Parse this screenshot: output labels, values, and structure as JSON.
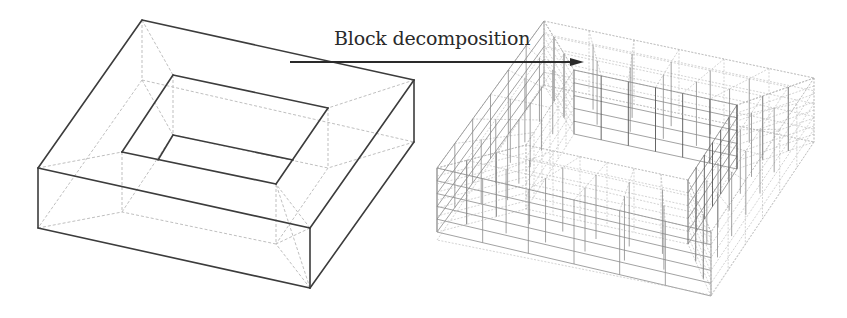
{
  "figure": {
    "annotation": {
      "label": "Block decomposition",
      "arrow_from": [
        290,
        62
      ],
      "arrow_to": [
        584,
        62
      ]
    },
    "left_model": {
      "description": "Square ring (frame) solid with rectangular hole, shown as wireframe with hidden dashed edges",
      "outer_top": [
        [
          142,
          20
        ],
        [
          414,
          80
        ],
        [
          310,
          228
        ],
        [
          38,
          168
        ]
      ],
      "outer_bottom": [
        [
          142,
          80
        ],
        [
          414,
          142
        ],
        [
          310,
          288
        ],
        [
          38,
          228
        ]
      ],
      "inner_top": [
        [
          173,
          75
        ],
        [
          328,
          108
        ],
        [
          276,
          184
        ],
        [
          122,
          152
        ]
      ],
      "inner_bottom": [
        [
          173,
          135
        ],
        [
          328,
          168
        ],
        [
          276,
          244
        ],
        [
          122,
          212
        ]
      ],
      "colors": {
        "solid_edge": "#3c3c3c",
        "hidden_edge": "#b8b8b8"
      }
    },
    "right_model": {
      "description": "Same ring solid decomposed into hexahedral blocks (structured mesh)",
      "outer_top": [
        [
          544,
          21
        ],
        [
          814,
          78
        ],
        [
          711,
          232
        ],
        [
          437,
          168
        ]
      ],
      "outer_bottom": [
        [
          544,
          85
        ],
        [
          814,
          142
        ],
        [
          711,
          295
        ],
        [
          437,
          240
        ]
      ],
      "inner_top": [
        [
          574,
          70
        ],
        [
          737,
          105
        ],
        [
          688,
          180
        ],
        [
          526,
          145
        ]
      ],
      "layers": 5,
      "colors": {
        "mesh_edge": "#8a8a8a",
        "mesh_dark": "#555555"
      }
    }
  }
}
